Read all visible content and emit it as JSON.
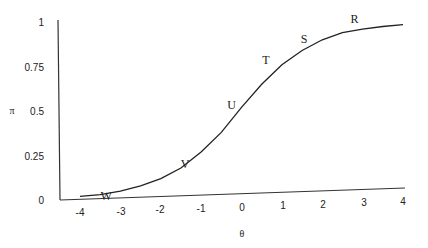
{
  "chart_data": {
    "type": "line",
    "title": "",
    "xlabel": "θ",
    "ylabel": "π",
    "xlim": [
      -4.5,
      4.2
    ],
    "ylim": [
      0,
      1
    ],
    "x_ticks": [
      "-4",
      "-3",
      "-2",
      "-1",
      "0",
      "1",
      "2",
      "3",
      "4"
    ],
    "y_ticks": [
      "0",
      "0.25",
      "0.5",
      "0.75",
      "1"
    ],
    "grid": false,
    "legend": null,
    "series": [
      {
        "name": "item characteristic curve",
        "x": [
          -4.0,
          -3.5,
          -3.0,
          -2.5,
          -2.0,
          -1.5,
          -1.0,
          -0.5,
          0.0,
          0.5,
          1.0,
          1.5,
          2.0,
          2.5,
          3.0,
          3.5,
          4.0
        ],
        "values": [
          0.02,
          0.03,
          0.05,
          0.08,
          0.12,
          0.18,
          0.27,
          0.38,
          0.52,
          0.65,
          0.76,
          0.84,
          0.9,
          0.94,
          0.96,
          0.975,
          0.985
        ]
      }
    ],
    "annotations": [
      {
        "label": "W",
        "x": -3.5,
        "y": 0.02
      },
      {
        "label": "V",
        "x": -1.4,
        "y": 0.2
      },
      {
        "label": "U",
        "x": -0.1,
        "y": 0.5
      },
      {
        "label": "T",
        "x": 0.8,
        "y": 0.74
      },
      {
        "label": "S",
        "x": 1.7,
        "y": 0.86
      },
      {
        "label": "R",
        "x": 2.9,
        "y": 0.97
      }
    ]
  }
}
